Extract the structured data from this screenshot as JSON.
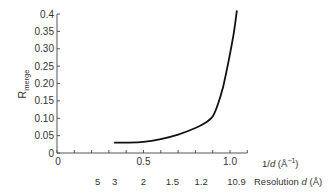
{
  "chart_data": {
    "type": "line",
    "title": "",
    "xlabel": "1/d (Å⁻¹)",
    "ylabel": "Rmerge",
    "xlim": [
      0,
      1.1
    ],
    "ylim": [
      0,
      0.4
    ],
    "grid": false,
    "legend": null,
    "x_ticks": [
      0,
      0.1,
      0.2,
      0.3,
      0.4,
      0.5,
      0.6,
      0.7,
      0.8,
      0.9,
      1.0,
      1.1
    ],
    "x_tick_labels": [
      {
        "value": 0,
        "label": "0"
      },
      {
        "value": 0.5,
        "label": "0.5"
      },
      {
        "value": 1.0,
        "label": "1.0"
      }
    ],
    "y_ticks": [
      0,
      0.05,
      0.1,
      0.15,
      0.2,
      0.25,
      0.3,
      0.35,
      0.4
    ],
    "y_tick_labels": [
      "0",
      "0.05",
      "0.10",
      "0.15",
      "0.20",
      "0.25",
      "0.30",
      "0.35",
      "0.4"
    ],
    "secondary_x_axis": {
      "label": "Resolution d (Å)",
      "ticks": [
        {
          "position": 0.2,
          "label": "5"
        },
        {
          "position": 0.333,
          "label": "3"
        },
        {
          "position": 0.5,
          "label": "2"
        },
        {
          "position": 0.667,
          "label": "1.5"
        },
        {
          "position": 0.833,
          "label": "1.2"
        },
        {
          "position": 1.0,
          "label": "1"
        },
        {
          "position": 1.111,
          "label": "0.9"
        }
      ]
    },
    "series": [
      {
        "name": "Rmerge",
        "x": [
          0.33,
          0.4,
          0.5,
          0.6,
          0.7,
          0.8,
          0.86,
          0.9,
          0.93,
          0.96,
          0.99,
          1.02,
          1.04
        ],
        "y": [
          0.03,
          0.03,
          0.032,
          0.04,
          0.053,
          0.072,
          0.088,
          0.105,
          0.14,
          0.19,
          0.26,
          0.34,
          0.41
        ]
      }
    ]
  },
  "labels": {
    "y_axis_main": "R",
    "y_axis_sub": "merge",
    "x_axis_prefix": "1/",
    "x_axis_var": "d",
    "x_axis_unit": " (Å",
    "x_axis_sup": "−1",
    "x_axis_close": ")",
    "res_prefix": "Resolution ",
    "res_var": "d",
    "res_unit": " (Å)"
  },
  "colors": {
    "axis": "#555555",
    "curve": "#111111",
    "text": "#333333"
  }
}
